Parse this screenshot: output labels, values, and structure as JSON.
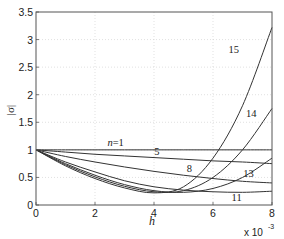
{
  "chart_data": {
    "type": "line",
    "title": "",
    "xlabel": "h",
    "ylabel": "|σ|",
    "x_multiplier_label": "x 10",
    "x_multiplier_exp": "-3",
    "xlim": [
      0,
      8
    ],
    "ylim": [
      0,
      3.5
    ],
    "x_ticks": [
      0,
      2,
      4,
      6,
      8
    ],
    "x_tick_labels": [
      "0",
      "2",
      "4",
      "6",
      "8"
    ],
    "y_ticks": [
      0,
      0.5,
      1,
      1.5,
      2,
      2.5,
      3,
      3.5
    ],
    "y_tick_labels": [
      "0",
      "0.5",
      "1",
      "1.5",
      "2",
      "2.5",
      "3",
      "3.5"
    ],
    "grid": true,
    "legend": "none (inline curve labels)",
    "x": [
      0,
      1,
      2,
      3,
      4,
      5,
      6,
      7,
      8
    ],
    "series": [
      {
        "name": "n=1",
        "label": "n=1",
        "values": [
          1.0,
          1.0,
          1.0,
          1.0,
          1.0,
          1.0,
          1.0,
          1.0,
          1.0
        ]
      },
      {
        "name": "n=5",
        "label": "5",
        "values": [
          1.0,
          0.96,
          0.92,
          0.89,
          0.86,
          0.83,
          0.8,
          0.78,
          0.75
        ]
      },
      {
        "name": "n=8",
        "label": "8",
        "values": [
          1.0,
          0.88,
          0.78,
          0.69,
          0.61,
          0.54,
          0.48,
          0.43,
          0.4
        ]
      },
      {
        "name": "n=11",
        "label": "11",
        "values": [
          1.0,
          0.78,
          0.6,
          0.44,
          0.33,
          0.27,
          0.24,
          0.23,
          0.25
        ]
      },
      {
        "name": "n=13",
        "label": "13",
        "values": [
          1.0,
          0.75,
          0.54,
          0.37,
          0.26,
          0.23,
          0.3,
          0.5,
          0.85
        ]
      },
      {
        "name": "n=14",
        "label": "14",
        "values": [
          1.0,
          0.73,
          0.51,
          0.34,
          0.24,
          0.26,
          0.5,
          1.0,
          1.75
        ]
      },
      {
        "name": "n=15",
        "label": "15",
        "values": [
          1.0,
          0.71,
          0.48,
          0.31,
          0.22,
          0.33,
          0.85,
          1.8,
          3.22
        ]
      }
    ],
    "annotations": [
      {
        "text": "n=1",
        "x": 2.7,
        "y": 1.07
      },
      {
        "text": "5",
        "x": 4.1,
        "y": 0.9
      },
      {
        "text": "8",
        "x": 5.2,
        "y": 0.6
      },
      {
        "text": "11",
        "x": 6.8,
        "y": 0.08
      },
      {
        "text": "13",
        "x": 7.2,
        "y": 0.5
      },
      {
        "text": "14",
        "x": 7.3,
        "y": 1.6
      },
      {
        "text": "15",
        "x": 6.7,
        "y": 2.75
      }
    ],
    "colors": {
      "line": "#333333",
      "axis": "#555555",
      "grid": "#cccccc",
      "background": "#ffffff"
    }
  }
}
